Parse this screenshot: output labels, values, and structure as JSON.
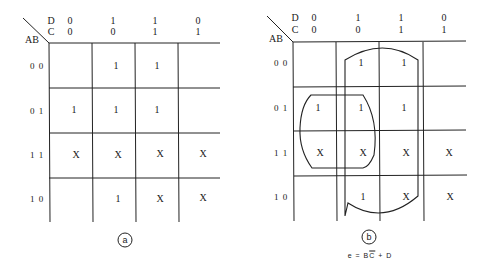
{
  "maps": [
    {
      "id": "a",
      "caption": "a",
      "corner_label_row": "AB",
      "col_var_top": "D",
      "col_var_bottom": "C",
      "columns": [
        {
          "d": "0",
          "c": "0"
        },
        {
          "d": "1",
          "c": "0"
        },
        {
          "d": "1",
          "c": "1"
        },
        {
          "d": "0",
          "c": "1"
        }
      ],
      "rows": [
        {
          "label": "0 0",
          "cells": [
            "",
            "1",
            "1",
            ""
          ]
        },
        {
          "label": "0 1",
          "cells": [
            "1",
            "1",
            "1",
            ""
          ]
        },
        {
          "label": "1 1",
          "cells": [
            "X",
            "X",
            "X",
            "X"
          ]
        },
        {
          "label": "1 0",
          "cells": [
            "",
            "1",
            "X",
            "X"
          ]
        }
      ]
    },
    {
      "id": "b",
      "caption": "b",
      "corner_label_row": "AB",
      "col_var_top": "D",
      "col_var_bottom": "C",
      "columns": [
        {
          "d": "0",
          "c": "0"
        },
        {
          "d": "1",
          "c": "0"
        },
        {
          "d": "1",
          "c": "1"
        },
        {
          "d": "0",
          "c": "1"
        }
      ],
      "rows": [
        {
          "label": "0 0",
          "cells": [
            "",
            "1",
            "1",
            ""
          ]
        },
        {
          "label": "0 1",
          "cells": [
            "1",
            "1",
            "1",
            ""
          ]
        },
        {
          "label": "1 1",
          "cells": [
            "X",
            "X",
            "X",
            "X"
          ]
        },
        {
          "label": "1 0",
          "cells": [
            "",
            "1",
            "X",
            "X"
          ]
        }
      ],
      "groupings": [
        {
          "term": "B C-bar",
          "covers_rows": [
            "0 1",
            "1 1"
          ],
          "covers_cols": [
            "00",
            "10"
          ]
        },
        {
          "term": "D",
          "covers_rows": [
            "0 0",
            "0 1",
            "1 1",
            "1 0"
          ],
          "covers_cols": [
            "10",
            "11"
          ]
        }
      ],
      "equation": {
        "lhs": "e",
        "eq": "=",
        "t1": "B",
        "t2": "C",
        "plus": "+",
        "t3": "D"
      }
    }
  ]
}
